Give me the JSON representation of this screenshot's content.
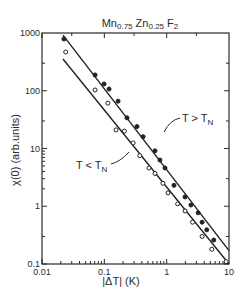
{
  "chart_data": {
    "type": "scatter",
    "title_parts": {
      "a": "Mn",
      "a_sub": "0.75",
      "b": " Zn",
      "b_sub": "0.25",
      "c": " F",
      "c_sub": "2"
    },
    "xlabel": "|ΔT|  (K)",
    "ylabel": "χ(0) (arb.units)",
    "xscale": "log",
    "yscale": "log",
    "xlim": [
      0.01,
      10
    ],
    "ylim": [
      0.1,
      1000
    ],
    "xticks": [
      {
        "v": 0.01,
        "label": "0.01"
      },
      {
        "v": 0.1,
        "label": "0.1"
      },
      {
        "v": 1,
        "label": "1"
      },
      {
        "v": 10,
        "label": "10"
      }
    ],
    "yticks": [
      {
        "v": 0.1,
        "label": "0.1"
      },
      {
        "v": 1,
        "label": "1"
      },
      {
        "v": 10,
        "label": "10"
      },
      {
        "v": 100,
        "label": "100"
      },
      {
        "v": 1000,
        "label": "1000"
      }
    ],
    "grid": false,
    "series": [
      {
        "name": "T > T_N",
        "marker": "filled-circle",
        "annotation": {
          "main": "T > T",
          "sub": "N"
        },
        "fit_line": [
          [
            0.0217,
            920
          ],
          [
            10,
            0.17
          ]
        ],
        "points": [
          [
            0.0225,
            787
          ],
          [
            0.071,
            188
          ],
          [
            0.099,
            131
          ],
          [
            0.119,
            107
          ],
          [
            0.166,
            66
          ],
          [
            0.231,
            34
          ],
          [
            0.334,
            24
          ],
          [
            0.419,
            16
          ],
          [
            0.65,
            9.1
          ],
          [
            0.78,
            6.3
          ],
          [
            0.94,
            4.6
          ],
          [
            1.31,
            2.3
          ],
          [
            1.97,
            1.45
          ],
          [
            2.45,
            1.05
          ],
          [
            3.2,
            0.77
          ],
          [
            3.7,
            0.53
          ],
          [
            4.4,
            0.39
          ],
          [
            5.7,
            0.26
          ]
        ]
      },
      {
        "name": "T < T_N",
        "marker": "open-circle",
        "annotation": {
          "main": "T < T",
          "sub": "N"
        },
        "fit_line": [
          [
            0.0217,
            355
          ],
          [
            10,
            0.1
          ]
        ],
        "points": [
          [
            0.024,
            469
          ],
          [
            0.071,
            103
          ],
          [
            0.114,
            61
          ],
          [
            0.154,
            21
          ],
          [
            0.21,
            20
          ],
          [
            0.29,
            12.5
          ],
          [
            0.37,
            7.5
          ],
          [
            0.52,
            4.6
          ],
          [
            0.65,
            3.7
          ],
          [
            0.87,
            2.5
          ],
          [
            1.05,
            1.7
          ],
          [
            1.5,
            1.1
          ],
          [
            1.97,
            0.83
          ],
          [
            2.6,
            0.53
          ],
          [
            3.7,
            0.3
          ],
          [
            5.3,
            0.18
          ],
          [
            9.0,
            0.11
          ]
        ]
      }
    ]
  }
}
